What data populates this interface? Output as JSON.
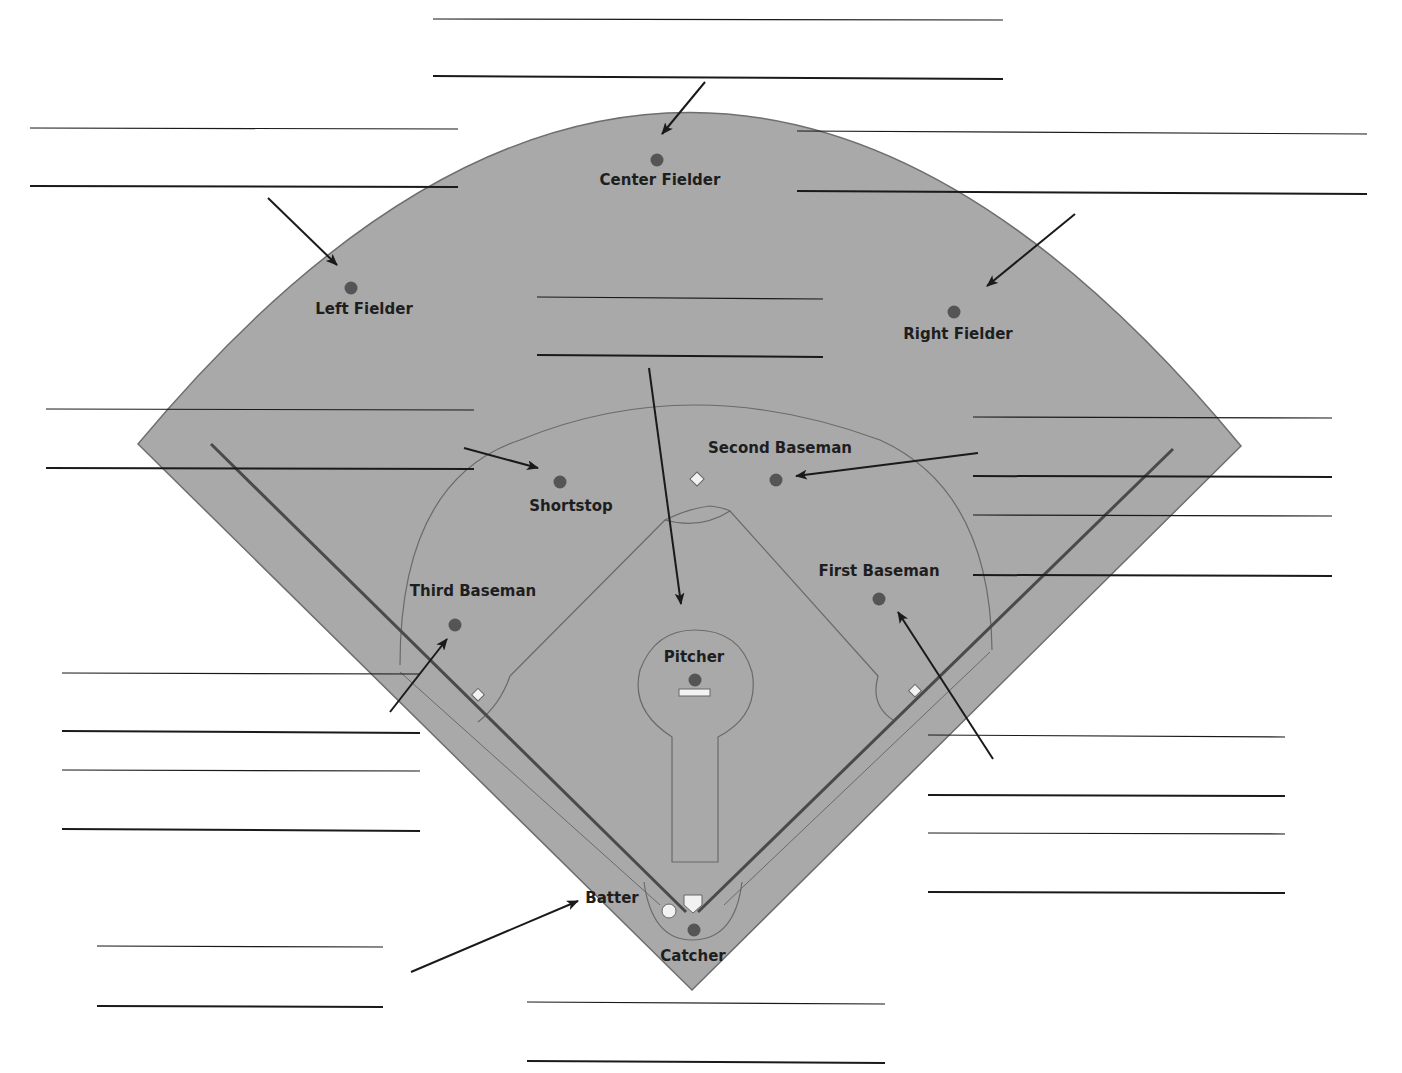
{
  "diagram": {
    "colors": {
      "field": "#a9a9a9",
      "field_edge": "#6e6e6e",
      "infield_line": "#6a6a6a",
      "foul_line": "#4a4a4a",
      "player_dot": "#555555",
      "base": "#f2f2f2",
      "text": "#1e1e1e",
      "answer_line": "#1a1a1a",
      "arrow": "#1a1a1a"
    },
    "positions": [
      {
        "id": "center-fielder",
        "label": "Center Fielder",
        "dot": [
          657,
          160
        ],
        "label_pos": [
          660,
          185
        ]
      },
      {
        "id": "left-fielder",
        "label": "Left Fielder",
        "dot": [
          351,
          288
        ],
        "label_pos": [
          364,
          314
        ]
      },
      {
        "id": "right-fielder",
        "label": "Right Fielder",
        "dot": [
          954,
          312
        ],
        "label_pos": [
          958,
          339
        ]
      },
      {
        "id": "second-baseman",
        "label": "Second Baseman",
        "dot": [
          776,
          480
        ],
        "label_pos": [
          780,
          453
        ]
      },
      {
        "id": "shortstop",
        "label": "Shortstop",
        "dot": [
          560,
          482
        ],
        "label_pos": [
          571,
          511
        ]
      },
      {
        "id": "third-baseman",
        "label": "Third Baseman",
        "dot": [
          455,
          625
        ],
        "label_pos": [
          473,
          596
        ]
      },
      {
        "id": "first-baseman",
        "label": "First Baseman",
        "dot": [
          879,
          599
        ],
        "label_pos": [
          879,
          576
        ]
      },
      {
        "id": "pitcher",
        "label": "Pitcher",
        "dot": [
          695,
          680
        ],
        "label_pos": [
          694,
          662
        ]
      },
      {
        "id": "catcher",
        "label": "Catcher",
        "dot": [
          694,
          930
        ],
        "label_pos": [
          693,
          961
        ]
      },
      {
        "id": "batter",
        "label": "Batter",
        "dot": [
          669,
          911
        ],
        "label_pos": [
          612,
          903
        ]
      }
    ],
    "answer_blanks": [
      {
        "id": "blank-center-fielder",
        "lines": [
          [
            433,
            19,
            1003,
            20
          ],
          [
            433,
            76,
            1003,
            79
          ]
        ],
        "arrow": [
          705,
          82,
          662,
          134
        ]
      },
      {
        "id": "blank-left-fielder",
        "lines": [
          [
            30,
            128,
            458,
            129
          ],
          [
            30,
            186,
            458,
            187
          ]
        ],
        "arrow": [
          268,
          198,
          337,
          265
        ]
      },
      {
        "id": "blank-right-fielder",
        "lines": [
          [
            797,
            131,
            1367,
            134
          ],
          [
            797,
            191,
            1367,
            194
          ]
        ],
        "arrow": [
          1075,
          214,
          987,
          286
        ]
      },
      {
        "id": "blank-pitcher",
        "lines": [
          [
            537,
            297,
            823,
            299
          ],
          [
            537,
            355,
            823,
            357
          ]
        ],
        "arrow": [
          649,
          368,
          681,
          604
        ]
      },
      {
        "id": "blank-shortstop",
        "lines": [
          [
            46,
            409,
            474,
            410
          ],
          [
            46,
            468,
            474,
            469
          ]
        ],
        "arrow": [
          464,
          448,
          538,
          468
        ]
      },
      {
        "id": "blank-second-baseman",
        "lines": [
          [
            973,
            417,
            1332,
            418
          ],
          [
            973,
            476,
            1332,
            477
          ]
        ],
        "arrow": [
          978,
          453,
          796,
          476
        ]
      },
      {
        "id": "blank-first-baseman",
        "lines": [
          [
            973,
            515,
            1332,
            516
          ],
          [
            973,
            575,
            1332,
            576
          ]
        ],
        "arrow": null
      },
      {
        "id": "blank-third-baseman",
        "lines": [
          [
            62,
            673,
            420,
            674
          ],
          [
            62,
            731,
            420,
            733
          ]
        ],
        "arrow": [
          390,
          712,
          447,
          639
        ]
      },
      {
        "id": "blank-first-baseman-2",
        "lines": [
          [
            928,
            735,
            1285,
            737
          ],
          [
            928,
            795,
            1285,
            796
          ]
        ],
        "arrow": [
          993,
          759,
          898,
          612
        ]
      },
      {
        "id": "blank-extra-left",
        "lines": [
          [
            62,
            770,
            420,
            771
          ],
          [
            62,
            829,
            420,
            831
          ]
        ],
        "arrow": null
      },
      {
        "id": "blank-extra-right",
        "lines": [
          [
            928,
            833,
            1285,
            834
          ],
          [
            928,
            892,
            1285,
            893
          ]
        ],
        "arrow": null
      },
      {
        "id": "blank-batter",
        "lines": [
          [
            97,
            946,
            383,
            947
          ],
          [
            97,
            1006,
            383,
            1007
          ]
        ],
        "arrow": [
          411,
          972,
          578,
          901
        ]
      },
      {
        "id": "blank-catcher",
        "lines": [
          [
            527,
            1002,
            885,
            1004
          ],
          [
            527,
            1061,
            885,
            1063
          ]
        ],
        "arrow": null
      }
    ]
  }
}
